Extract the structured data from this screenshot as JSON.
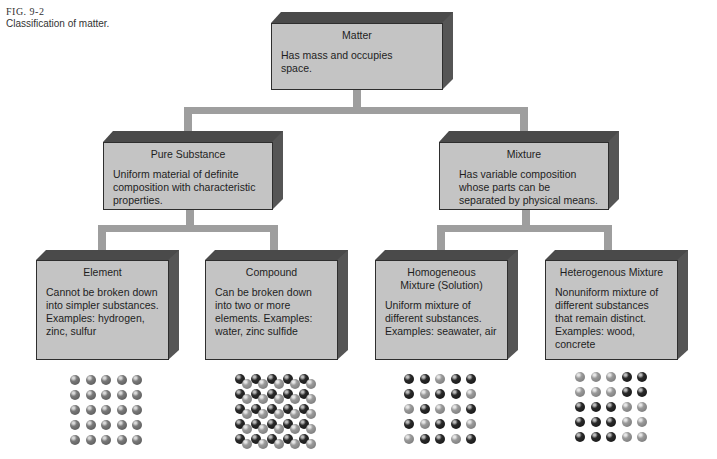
{
  "caption": {
    "figure": "FIG. 9-2",
    "text": "Classification of matter."
  },
  "nodes": {
    "matter": {
      "title": "Matter",
      "description": "Has mass and occupies space."
    },
    "pure_substance": {
      "title": "Pure Substance",
      "description": "Uniform material of definite composition with characteristic properties."
    },
    "mixture": {
      "title": "Mixture",
      "description": "Has variable composition whose parts can be separated by physical means."
    },
    "element": {
      "title": "Element",
      "description": "Cannot be broken down into simpler substances. Examples: hydrogen, zinc, sulfur"
    },
    "compound": {
      "title": "Compound",
      "description": "Can be broken down into two or more elements. Examples: water, zinc sulfide"
    },
    "homogeneous": {
      "title": "Homogeneous Mixture (Solution)",
      "description": "Uniform mixture of different substances. Examples: seawater, air"
    },
    "heterogeneous": {
      "title": "Heterogenous Mixture",
      "description": "Nonuniform mixture of different substances that remain distinct. Examples: wood, concrete"
    }
  },
  "particle_grids": {
    "element": [
      "MMMMM",
      "MMMMM",
      "MMMMM",
      "MMMMM",
      "MMMMM"
    ],
    "compound": "pairs",
    "homogeneous": [
      "DDGDD",
      "DGDDG",
      "GDGGD",
      "DGDDG",
      "GDDGD"
    ],
    "heterogeneous": [
      "GGGDD",
      "GGGDD",
      "DDDGG",
      "DDDGG",
      "DDDGG"
    ]
  },
  "colors": {
    "box_front": "#c4c4c4",
    "box_depth": "#4a4a4a",
    "connector": "#9e9e9e"
  }
}
